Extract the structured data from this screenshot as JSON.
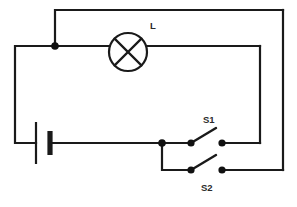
{
  "diagram": {
    "type": "electrical-schematic",
    "background_color": "#ffffff",
    "wire_color": "#1a1a1a",
    "label_color": "#2b2b2b"
  },
  "labels": {
    "lamp": "L",
    "switch_1": "S1",
    "switch_2": "S2"
  },
  "components": [
    {
      "id": "lamp",
      "name": "lamp",
      "symbol": "circle-with-cross",
      "label": "L",
      "center_x": 128,
      "center_y": 52,
      "radius": 19
    },
    {
      "id": "battery",
      "name": "battery",
      "symbol": "cell-long-short-plates",
      "label": "",
      "x": 40,
      "y": 143,
      "plate_long_x": 36,
      "plate_short_x": 50
    },
    {
      "id": "switch-1",
      "name": "switch-s1",
      "symbol": "spst-open-switch",
      "label": "S1",
      "left_node_x": 191,
      "left_node_y": 143,
      "right_node_x": 222,
      "right_node_y": 143,
      "state": "open"
    },
    {
      "id": "switch-2",
      "name": "switch-s2",
      "symbol": "spst-open-switch",
      "label": "S2",
      "left_node_x": 191,
      "left_node_y": 170,
      "right_node_x": 222,
      "right_node_y": 170,
      "state": "open"
    }
  ],
  "junctions": [
    {
      "name": "top-left-node",
      "x": 55,
      "y": 46
    },
    {
      "name": "switch-branch-node",
      "x": 162,
      "y": 143
    }
  ]
}
